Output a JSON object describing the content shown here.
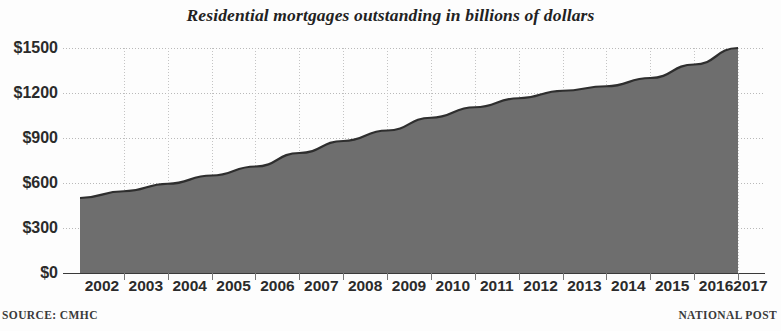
{
  "chart_data": {
    "type": "area",
    "title": "Residential mortgages outstanding in billions of dollars",
    "xlabel": "",
    "ylabel": "",
    "categories": [
      "2002",
      "2003",
      "2004",
      "2005",
      "2006",
      "2007",
      "2008",
      "2009",
      "2010",
      "2011",
      "2012",
      "2013",
      "2014",
      "2015",
      "2016",
      "2017"
    ],
    "values": [
      500,
      545,
      595,
      650,
      710,
      800,
      880,
      950,
      1035,
      1105,
      1165,
      1215,
      1245,
      1300,
      1390,
      1500
    ],
    "series": [
      {
        "name": "Residential mortgages outstanding",
        "values": [
          500,
          545,
          595,
          650,
          710,
          800,
          880,
          950,
          1035,
          1105,
          1165,
          1215,
          1245,
          1300,
          1390,
          1500
        ]
      }
    ],
    "ylim": [
      0,
      1500
    ],
    "yticks": [
      0,
      300,
      600,
      900,
      1200,
      1500
    ],
    "ytick_labels": [
      "$0",
      "$300",
      "$600",
      "$900",
      "$1200",
      "$1500"
    ],
    "xtick_labels": [
      "2002",
      "2003",
      "2004",
      "2005",
      "2006",
      "2007",
      "2008",
      "2009",
      "2010",
      "2011",
      "2012",
      "2013",
      "2014",
      "2015",
      "2016",
      "2017"
    ],
    "grid": true,
    "legend": null,
    "legend_position": "none",
    "area_fill_color": "#6e6e6e",
    "area_line_color": "#2e2e2e",
    "grid_color": "#b9b9b9",
    "axis_color": "#3a3a3a"
  },
  "footer": {
    "source": "SOURCE: CMHC",
    "brand": "NATIONAL POST"
  }
}
